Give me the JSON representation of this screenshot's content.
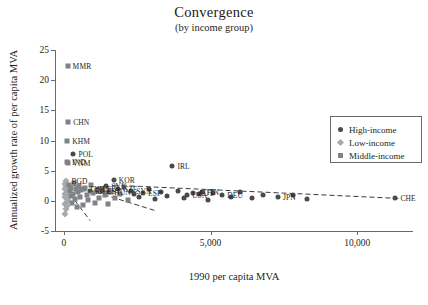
{
  "chart_data": {
    "type": "scatter",
    "title": "Convergence",
    "subtitle": "(by income group)",
    "xlabel": "1990 per capita MVA",
    "ylabel": "Annualized growth rate of per capita MVA",
    "xlim": [
      -300,
      11900
    ],
    "ylim": [
      -5,
      25
    ],
    "xticks": [
      0,
      5000,
      10000
    ],
    "xticklabels": [
      "0",
      "5,000",
      "10,000"
    ],
    "yticks": [
      -5,
      0,
      5,
      10,
      15,
      20,
      25
    ],
    "yticklabels": [
      "-5",
      "0",
      "5",
      "10",
      "15",
      "20",
      "25"
    ],
    "grid": false,
    "legend_position": "upper right",
    "legend": [
      {
        "label": "High-income",
        "marker": "circle",
        "color": "#4a4a4c",
        "group": "high"
      },
      {
        "label": "Low-income",
        "marker": "diamond",
        "color": "#a7a9ac",
        "group": "low"
      },
      {
        "label": "Middle-income",
        "marker": "square",
        "color": "#808285",
        "group": "middle"
      }
    ],
    "trendlines": [
      {
        "name": "high-income-fit",
        "style": "dashed",
        "x0": 1700,
        "y0": 2.6,
        "x1": 11400,
        "y1": 0.4
      },
      {
        "name": "middle-income-fit",
        "style": "dashed",
        "x0": 60,
        "y0": 3.0,
        "x1": 3100,
        "y1": -1.6
      },
      {
        "name": "low-income-fit",
        "style": "dashed",
        "x0": 40,
        "y0": 2.2,
        "x1": 900,
        "y1": -3.3
      }
    ],
    "points": [
      {
        "label": "MMR",
        "group": "middle",
        "x": 130,
        "y": 22.3,
        "labeled": true
      },
      {
        "label": "CHN",
        "group": "middle",
        "x": 150,
        "y": 13.0,
        "labeled": true
      },
      {
        "label": "KHM",
        "group": "middle",
        "x": 120,
        "y": 9.9,
        "labeled": true
      },
      {
        "label": "POL",
        "group": "high",
        "x": 330,
        "y": 7.7,
        "labeled": true
      },
      {
        "label": "IND",
        "group": "middle",
        "x": 110,
        "y": 6.4,
        "labeled": true
      },
      {
        "label": "VNM",
        "group": "middle",
        "x": 130,
        "y": 6.3,
        "labeled": true
      },
      {
        "label": "BGD",
        "group": "low",
        "x": 90,
        "y": 3.3,
        "labeled": true
      },
      {
        "label": "KOR",
        "group": "high",
        "x": 1700,
        "y": 3.5,
        "labeled": true
      },
      {
        "label": "IRL",
        "group": "high",
        "x": 3700,
        "y": 5.7,
        "labeled": true
      },
      {
        "label": "SVK",
        "group": "high",
        "x": 1450,
        "y": 2.4,
        "labeled": true
      },
      {
        "label": "CZE",
        "group": "high",
        "x": 1850,
        "y": 2.0,
        "labeled": true
      },
      {
        "label": "LTU",
        "group": "high",
        "x": 1150,
        "y": 1.9,
        "labeled": true
      },
      {
        "label": "TUR",
        "group": "middle",
        "x": 700,
        "y": 1.9,
        "labeled": true
      },
      {
        "label": "ROU",
        "group": "high",
        "x": 900,
        "y": 1.6,
        "labeled": true
      },
      {
        "label": "EST",
        "group": "high",
        "x": 1300,
        "y": 1.7,
        "labeled": true
      },
      {
        "label": "HUN",
        "group": "high",
        "x": 1550,
        "y": 1.5,
        "labeled": true
      },
      {
        "label": "SVN",
        "group": "high",
        "x": 2300,
        "y": 1.6,
        "labeled": true
      },
      {
        "label": "ESP",
        "group": "high",
        "x": 2700,
        "y": 1.3,
        "labeled": true
      },
      {
        "label": "AUT",
        "group": "high",
        "x": 4400,
        "y": 1.3,
        "labeled": true
      },
      {
        "label": "FIN",
        "group": "high",
        "x": 4700,
        "y": 1.5,
        "labeled": true
      },
      {
        "label": "DEU",
        "group": "high",
        "x": 5400,
        "y": 1.0,
        "labeled": true
      },
      {
        "label": "USA",
        "group": "high",
        "x": 4200,
        "y": 1.0,
        "labeled": true
      },
      {
        "label": "JPN",
        "group": "high",
        "x": 7300,
        "y": 0.7,
        "labeled": true
      },
      {
        "label": "CHE",
        "group": "high",
        "x": 11300,
        "y": 0.5,
        "labeled": true
      },
      {
        "label": "",
        "group": "low",
        "x": 40,
        "y": 2.0,
        "labeled": false
      },
      {
        "label": "",
        "group": "low",
        "x": 55,
        "y": 1.2,
        "labeled": false
      },
      {
        "label": "",
        "group": "low",
        "x": 60,
        "y": 0.4,
        "labeled": false
      },
      {
        "label": "",
        "group": "low",
        "x": 45,
        "y": -0.5,
        "labeled": false
      },
      {
        "label": "",
        "group": "low",
        "x": 70,
        "y": -1.4,
        "labeled": false
      },
      {
        "label": "",
        "group": "low",
        "x": 50,
        "y": 2.8,
        "labeled": false
      },
      {
        "label": "",
        "group": "low",
        "x": 85,
        "y": 0.9,
        "labeled": false
      },
      {
        "label": "",
        "group": "low",
        "x": 35,
        "y": -2.2,
        "labeled": false
      },
      {
        "label": "",
        "group": "low",
        "x": 95,
        "y": -0.2,
        "labeled": false
      },
      {
        "label": "",
        "group": "low",
        "x": 110,
        "y": 1.6,
        "labeled": false
      },
      {
        "label": "",
        "group": "low",
        "x": 75,
        "y": 2.3,
        "labeled": false
      },
      {
        "label": "",
        "group": "low",
        "x": 120,
        "y": -0.9,
        "labeled": false
      },
      {
        "label": "",
        "group": "low",
        "x": 30,
        "y": 0.7,
        "labeled": false
      },
      {
        "label": "",
        "group": "low",
        "x": 160,
        "y": 0.2,
        "labeled": false
      },
      {
        "label": "",
        "group": "middle",
        "x": 180,
        "y": 2.6,
        "labeled": false
      },
      {
        "label": "",
        "group": "middle",
        "x": 210,
        "y": 1.7,
        "labeled": false
      },
      {
        "label": "",
        "group": "middle",
        "x": 240,
        "y": 0.8,
        "labeled": false
      },
      {
        "label": "",
        "group": "middle",
        "x": 260,
        "y": 2.1,
        "labeled": false
      },
      {
        "label": "",
        "group": "middle",
        "x": 290,
        "y": -0.4,
        "labeled": false
      },
      {
        "label": "",
        "group": "middle",
        "x": 320,
        "y": 1.2,
        "labeled": false
      },
      {
        "label": "",
        "group": "middle",
        "x": 350,
        "y": 2.9,
        "labeled": false
      },
      {
        "label": "",
        "group": "middle",
        "x": 380,
        "y": 0.3,
        "labeled": false
      },
      {
        "label": "",
        "group": "middle",
        "x": 410,
        "y": 1.9,
        "labeled": false
      },
      {
        "label": "",
        "group": "middle",
        "x": 450,
        "y": -1.1,
        "labeled": false
      },
      {
        "label": "",
        "group": "middle",
        "x": 480,
        "y": 1.4,
        "labeled": false
      },
      {
        "label": "",
        "group": "middle",
        "x": 520,
        "y": 2.4,
        "labeled": false
      },
      {
        "label": "",
        "group": "middle",
        "x": 560,
        "y": 0.6,
        "labeled": false
      },
      {
        "label": "",
        "group": "middle",
        "x": 600,
        "y": 1.8,
        "labeled": false
      },
      {
        "label": "",
        "group": "middle",
        "x": 650,
        "y": -0.7,
        "labeled": false
      },
      {
        "label": "",
        "group": "middle",
        "x": 720,
        "y": 2.2,
        "labeled": false
      },
      {
        "label": "",
        "group": "middle",
        "x": 780,
        "y": 1.0,
        "labeled": false
      },
      {
        "label": "",
        "group": "middle",
        "x": 840,
        "y": 0.1,
        "labeled": false
      },
      {
        "label": "",
        "group": "middle",
        "x": 910,
        "y": 2.7,
        "labeled": false
      },
      {
        "label": "",
        "group": "middle",
        "x": 980,
        "y": 1.3,
        "labeled": false
      },
      {
        "label": "",
        "group": "middle",
        "x": 1050,
        "y": -0.3,
        "labeled": false
      },
      {
        "label": "",
        "group": "middle",
        "x": 1120,
        "y": 1.6,
        "labeled": false
      },
      {
        "label": "",
        "group": "middle",
        "x": 1200,
        "y": 0.5,
        "labeled": false
      },
      {
        "label": "",
        "group": "middle",
        "x": 1300,
        "y": 2.0,
        "labeled": false
      },
      {
        "label": "",
        "group": "middle",
        "x": 1400,
        "y": 0.9,
        "labeled": false
      },
      {
        "label": "",
        "group": "middle",
        "x": 1500,
        "y": -0.6,
        "labeled": false
      },
      {
        "label": "",
        "group": "middle",
        "x": 1600,
        "y": 1.5,
        "labeled": false
      },
      {
        "label": "",
        "group": "middle",
        "x": 1750,
        "y": 0.4,
        "labeled": false
      },
      {
        "label": "",
        "group": "middle",
        "x": 1900,
        "y": 1.1,
        "labeled": false
      },
      {
        "label": "",
        "group": "middle",
        "x": 2050,
        "y": 2.3,
        "labeled": false
      },
      {
        "label": "",
        "group": "middle",
        "x": 2200,
        "y": 0.2,
        "labeled": false
      },
      {
        "label": "",
        "group": "high",
        "x": 2400,
        "y": 1.2,
        "labeled": false
      },
      {
        "label": "",
        "group": "high",
        "x": 2550,
        "y": 0.6,
        "labeled": false
      },
      {
        "label": "",
        "group": "high",
        "x": 2900,
        "y": 1.9,
        "labeled": false
      },
      {
        "label": "",
        "group": "high",
        "x": 3100,
        "y": 0.3,
        "labeled": false
      },
      {
        "label": "",
        "group": "high",
        "x": 3300,
        "y": 1.4,
        "labeled": false
      },
      {
        "label": "",
        "group": "high",
        "x": 3500,
        "y": 0.8,
        "labeled": false
      },
      {
        "label": "",
        "group": "high",
        "x": 3900,
        "y": 1.6,
        "labeled": false
      },
      {
        "label": "",
        "group": "high",
        "x": 4100,
        "y": 0.5,
        "labeled": false
      },
      {
        "label": "",
        "group": "high",
        "x": 4600,
        "y": 1.1,
        "labeled": false
      },
      {
        "label": "",
        "group": "high",
        "x": 4900,
        "y": 0.2,
        "labeled": false
      },
      {
        "label": "",
        "group": "high",
        "x": 5100,
        "y": 1.3,
        "labeled": false
      },
      {
        "label": "",
        "group": "high",
        "x": 5700,
        "y": 0.7,
        "labeled": false
      },
      {
        "label": "",
        "group": "high",
        "x": 6000,
        "y": 1.5,
        "labeled": false
      },
      {
        "label": "",
        "group": "high",
        "x": 6400,
        "y": 0.4,
        "labeled": false
      },
      {
        "label": "",
        "group": "high",
        "x": 6800,
        "y": 1.0,
        "labeled": false
      },
      {
        "label": "",
        "group": "high",
        "x": 7800,
        "y": 0.9,
        "labeled": false
      },
      {
        "label": "",
        "group": "high",
        "x": 8300,
        "y": 0.3,
        "labeled": false
      }
    ]
  }
}
